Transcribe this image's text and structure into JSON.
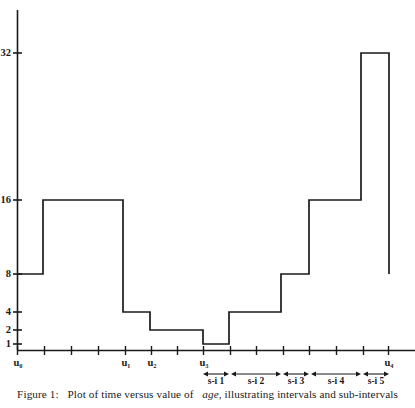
{
  "figure": {
    "caption_prefix": "Figure 1:",
    "caption_body_1": "Plot of time versus value of",
    "caption_emphasis": "age",
    "caption_body_2": ", illustrating intervals and sub-intervals",
    "caption_full": "Figure 1: Plot of time versus value of age, illustrating intervals and sub-intervals"
  },
  "chart_data": {
    "type": "line",
    "subtype": "step-function",
    "title": "",
    "xlabel": "",
    "ylabel": "",
    "grid": false,
    "legend": null,
    "line_color": "#1a1a1a",
    "background_color": "#ffffff",
    "y_axis": {
      "scale": "log2",
      "tick_labels": [
        "32",
        "16",
        "8",
        "4",
        "2",
        "1"
      ],
      "tick_values": [
        32,
        16,
        8,
        4,
        2,
        1
      ],
      "ylim": [
        1,
        48
      ]
    },
    "x_axis": {
      "interval_labels": [
        "u0",
        "u1",
        "u2",
        "u3",
        "u4"
      ],
      "interval_labels_display": [
        "u₀",
        "u₁",
        "u₂",
        "u₃",
        "u₄"
      ],
      "interval_label_x": [
        17,
        125,
        151,
        203,
        388
      ],
      "minor_tick_x": [
        44,
        71,
        98,
        177,
        230,
        256,
        283,
        309,
        336,
        363
      ],
      "xlim": [
        17,
        415
      ]
    },
    "steps": [
      {
        "x_start": 17,
        "x_end": 43,
        "value": 8
      },
      {
        "x_start": 43,
        "x_end": 123,
        "value": 16
      },
      {
        "x_start": 123,
        "x_end": 150,
        "value": 4
      },
      {
        "x_start": 150,
        "x_end": 203,
        "value": 2
      },
      {
        "x_start": 203,
        "x_end": 229,
        "value": 1
      },
      {
        "x_start": 229,
        "x_end": 281,
        "value": 4
      },
      {
        "x_start": 281,
        "x_end": 309,
        "value": 8
      },
      {
        "x_start": 309,
        "x_end": 361,
        "value": 16
      },
      {
        "x_start": 361,
        "x_end": 389,
        "value": 32
      },
      {
        "x_start": 389,
        "x_end": 389,
        "value": 8
      }
    ],
    "subintervals": [
      {
        "label": "s-i 1",
        "x_start": 203,
        "x_end": 229
      },
      {
        "label": "s-i 2",
        "x_start": 231,
        "x_end": 281
      },
      {
        "label": "s-i 3",
        "x_start": 283,
        "x_end": 309
      },
      {
        "label": "s-i 4",
        "x_start": 311,
        "x_end": 361
      },
      {
        "label": "s-i 5",
        "x_start": 363,
        "x_end": 389
      }
    ]
  }
}
